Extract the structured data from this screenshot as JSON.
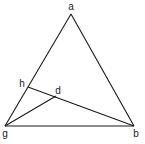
{
  "diagram": {
    "type": "geometry",
    "colors": {
      "line": "#1a1a1a",
      "background": "#ffffff"
    },
    "points": {
      "a": {
        "label": "a",
        "x": 71,
        "y": 14,
        "lx": 71,
        "ly": 10
      },
      "g": {
        "label": "g",
        "x": 5,
        "y": 126,
        "lx": 5,
        "ly": 137
      },
      "b": {
        "label": "b",
        "x": 134,
        "y": 126,
        "lx": 136,
        "ly": 137
      },
      "h": {
        "label": "h",
        "x": 28,
        "y": 87,
        "lx": 22,
        "ly": 87
      },
      "d": {
        "label": "d",
        "x": 56,
        "y": 96,
        "lx": 58,
        "ly": 94
      }
    },
    "segments": [
      {
        "from": "a",
        "to": "g"
      },
      {
        "from": "a",
        "to": "b"
      },
      {
        "from": "g",
        "to": "b"
      },
      {
        "from": "h",
        "to": "b"
      },
      {
        "from": "g",
        "to": "d"
      }
    ]
  }
}
